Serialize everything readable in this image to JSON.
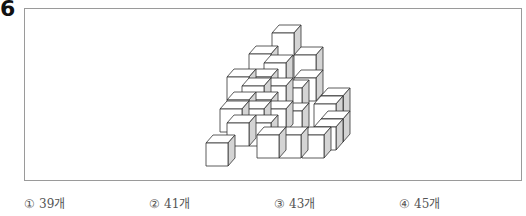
{
  "question": {
    "number": "6"
  },
  "figure": {
    "stroke_color": "#333333",
    "front_fill": "#ffffff",
    "top_fill": "#ffffff",
    "side_fill": "#d4d4d4",
    "cube_width": 22,
    "cube_height": 23,
    "depth_dx": 7,
    "depth_dy": -8,
    "cubes": [
      {
        "x": 272,
        "y": 33
      },
      {
        "x": 294,
        "y": 55
      },
      {
        "x": 249,
        "y": 54
      },
      {
        "x": 249,
        "y": 77
      },
      {
        "x": 294,
        "y": 78
      },
      {
        "x": 227,
        "y": 77
      },
      {
        "x": 227,
        "y": 100
      },
      {
        "x": 227,
        "y": 123
      },
      {
        "x": 249,
        "y": 100
      },
      {
        "x": 249,
        "y": 123
      },
      {
        "x": 264,
        "y": 63
      },
      {
        "x": 264,
        "y": 86
      },
      {
        "x": 242,
        "y": 86
      },
      {
        "x": 242,
        "y": 109
      },
      {
        "x": 264,
        "y": 109
      },
      {
        "x": 220,
        "y": 109
      },
      {
        "x": 321,
        "y": 96
      },
      {
        "x": 321,
        "y": 119
      },
      {
        "x": 314,
        "y": 104
      },
      {
        "x": 314,
        "y": 127
      },
      {
        "x": 280,
        "y": 88
      },
      {
        "x": 280,
        "y": 111
      },
      {
        "x": 257,
        "y": 135
      },
      {
        "x": 279,
        "y": 135
      },
      {
        "x": 302,
        "y": 135
      },
      {
        "x": 206,
        "y": 143
      }
    ]
  },
  "options": [
    {
      "mark": "①",
      "label": "39개"
    },
    {
      "mark": "②",
      "label": "41개"
    },
    {
      "mark": "③",
      "label": "43개"
    },
    {
      "mark": "④",
      "label": "45개"
    }
  ]
}
